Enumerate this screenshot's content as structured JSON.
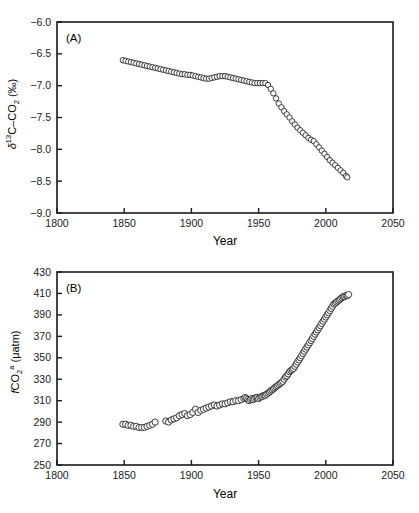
{
  "figure": {
    "background": "#ffffff",
    "marker_fill": "#ffffff",
    "marker_stroke": "#1a1a1a",
    "axis_color": "#1a1a1a"
  },
  "panels": [
    {
      "tag": "(A)",
      "tag_name": "panel-a-tag",
      "ylabel_parts": {
        "delta": "δ",
        "iso": "13",
        "species": "C–CO",
        "sub": "2",
        "unit": "(‰)"
      },
      "ylabel_plain": "δ13C–CO2 (‰)",
      "xlabel": "Year",
      "xticks": [
        "1800",
        "1850",
        "1900",
        "1950",
        "2000",
        "2050"
      ],
      "yticks": [
        "-6.0",
        "-6.5",
        "-7.0",
        "-7.5",
        "-8.0",
        "-8.5",
        "-9.0"
      ]
    },
    {
      "tag": "(B)",
      "tag_name": "panel-b-tag",
      "ylabel_parts": {
        "f": "f",
        "species": "CO",
        "sub": "2",
        "sup": "a",
        "unit": "(μatm)"
      },
      "ylabel_plain": "fCO2a (μatm)",
      "xlabel": "Year",
      "xticks": [
        "1800",
        "1850",
        "1900",
        "1950",
        "2000",
        "2050"
      ],
      "yticks": [
        "430",
        "410",
        "390",
        "370",
        "350",
        "330",
        "310",
        "290",
        "270",
        "250"
      ]
    }
  ],
  "chart_data": [
    {
      "type": "scatter",
      "panel": "A",
      "title": "",
      "xlabel": "Year",
      "ylabel": "δ13C–CO2 (‰)",
      "xlim": [
        1800,
        2050
      ],
      "ylim": [
        -9.0,
        -6.0
      ],
      "xticks": [
        1800,
        1850,
        1900,
        1950,
        2000,
        2050
      ],
      "yticks": [
        -9.0,
        -8.5,
        -8.0,
        -7.5,
        -7.0,
        -6.5,
        -6.0
      ],
      "grid": false,
      "legend": null,
      "marker": "open-circle",
      "series": [
        {
          "name": "δ13C–CO2",
          "x": [
            1849,
            1851,
            1853,
            1855,
            1857,
            1859,
            1861,
            1863,
            1865,
            1867,
            1869,
            1871,
            1873,
            1875,
            1877,
            1879,
            1881,
            1883,
            1885,
            1887,
            1889,
            1891,
            1893,
            1895,
            1897,
            1899,
            1901,
            1903,
            1905,
            1907,
            1909,
            1911,
            1913,
            1915,
            1917,
            1919,
            1921,
            1923,
            1925,
            1927,
            1929,
            1931,
            1933,
            1935,
            1937,
            1939,
            1941,
            1943,
            1945,
            1947,
            1949,
            1951,
            1953,
            1955,
            1957,
            1959,
            1961,
            1963,
            1965,
            1967,
            1969,
            1971,
            1973,
            1975,
            1977,
            1979,
            1981,
            1983,
            1985,
            1987,
            1989,
            1991,
            1993,
            1995,
            1997,
            1999,
            2001,
            2003,
            2005,
            2007,
            2009,
            2011,
            2013,
            2015,
            2016
          ],
          "y": [
            -6.6,
            -6.61,
            -6.62,
            -6.63,
            -6.64,
            -6.65,
            -6.66,
            -6.67,
            -6.68,
            -6.69,
            -6.7,
            -6.71,
            -6.72,
            -6.73,
            -6.74,
            -6.75,
            -6.76,
            -6.77,
            -6.78,
            -6.79,
            -6.8,
            -6.81,
            -6.82,
            -6.82,
            -6.83,
            -6.83,
            -6.84,
            -6.85,
            -6.86,
            -6.87,
            -6.88,
            -6.89,
            -6.89,
            -6.88,
            -6.87,
            -6.86,
            -6.85,
            -6.85,
            -6.85,
            -6.86,
            -6.87,
            -6.88,
            -6.89,
            -6.9,
            -6.91,
            -6.92,
            -6.93,
            -6.94,
            -6.95,
            -6.96,
            -6.96,
            -6.96,
            -6.96,
            -6.96,
            -6.99,
            -7.05,
            -7.12,
            -7.2,
            -7.28,
            -7.34,
            -7.4,
            -7.45,
            -7.5,
            -7.56,
            -7.61,
            -7.66,
            -7.7,
            -7.74,
            -7.78,
            -7.82,
            -7.85,
            -7.87,
            -7.92,
            -7.97,
            -8.02,
            -8.07,
            -8.12,
            -8.17,
            -8.21,
            -8.25,
            -8.29,
            -8.33,
            -8.37,
            -8.42,
            -8.44
          ]
        }
      ]
    },
    {
      "type": "scatter",
      "panel": "B",
      "title": "",
      "xlabel": "Year",
      "ylabel": "fCO2a (μatm)",
      "xlim": [
        1800,
        2050
      ],
      "ylim": [
        250,
        430
      ],
      "xticks": [
        1800,
        1850,
        1900,
        1950,
        2000,
        2050
      ],
      "yticks": [
        250,
        270,
        290,
        310,
        330,
        350,
        370,
        390,
        410,
        430
      ],
      "grid": false,
      "legend": null,
      "marker": "open-circle",
      "series": [
        {
          "name": "fCO2a",
          "x": [
            1849,
            1851,
            1853,
            1855,
            1857,
            1859,
            1861,
            1863,
            1865,
            1867,
            1869,
            1871,
            1873,
            1881,
            1883,
            1885,
            1887,
            1889,
            1891,
            1893,
            1895,
            1897,
            1899,
            1901,
            1903,
            1905,
            1907,
            1909,
            1911,
            1913,
            1915,
            1917,
            1919,
            1921,
            1923,
            1925,
            1927,
            1929,
            1931,
            1933,
            1935,
            1937,
            1939,
            1940,
            1941,
            1942,
            1943,
            1944,
            1945,
            1946,
            1947,
            1948,
            1949,
            1950,
            1951,
            1952,
            1953,
            1954,
            1955,
            1956,
            1957,
            1958,
            1959,
            1960,
            1961,
            1962,
            1963,
            1964,
            1965,
            1966,
            1967,
            1968,
            1969,
            1970,
            1971,
            1972,
            1973,
            1974,
            1975,
            1976,
            1977,
            1978,
            1979,
            1980,
            1981,
            1982,
            1983,
            1984,
            1985,
            1986,
            1987,
            1988,
            1989,
            1990,
            1991,
            1992,
            1993,
            1994,
            1995,
            1996,
            1997,
            1998,
            1999,
            2000,
            2001,
            2002,
            2003,
            2004,
            2005,
            2006,
            2007,
            2008,
            2009,
            2010,
            2011,
            2012,
            2013,
            2014,
            2015,
            2016,
            2017
          ],
          "y": [
            288,
            288,
            287,
            287,
            286,
            286,
            285,
            285,
            285,
            286,
            287,
            288,
            290,
            291,
            290,
            292,
            293,
            294,
            296,
            297,
            298,
            296,
            297,
            299,
            302,
            299,
            301,
            302,
            303,
            304,
            305,
            306,
            305,
            306,
            307,
            307,
            308,
            309,
            309,
            310,
            310,
            311,
            312,
            313,
            312,
            311,
            310,
            311,
            312,
            311,
            312,
            313,
            313,
            312,
            313,
            314,
            314,
            315,
            315,
            316,
            317,
            318,
            319,
            320,
            321,
            322,
            323,
            324,
            325,
            326,
            327,
            328,
            330,
            332,
            333,
            335,
            337,
            338,
            339,
            340,
            342,
            344,
            346,
            348,
            350,
            352,
            354,
            356,
            358,
            360,
            362,
            364,
            366,
            368,
            370,
            372,
            374,
            376,
            378,
            380,
            382,
            384,
            386,
            388,
            390,
            392,
            394,
            396,
            398,
            400,
            401,
            402,
            403,
            404,
            405,
            406,
            407,
            407,
            408,
            408,
            409
          ]
        }
      ]
    }
  ]
}
